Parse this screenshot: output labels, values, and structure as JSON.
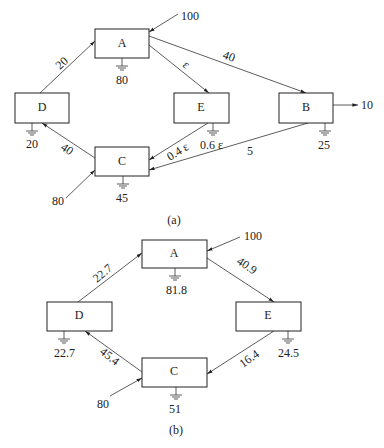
{
  "diagram_a": {
    "caption": "(a)",
    "nodes": {
      "A": {
        "label": "A",
        "loss": "80"
      },
      "B": {
        "label": "B",
        "loss": "25"
      },
      "C": {
        "label": "C",
        "loss": "45"
      },
      "D": {
        "label": "D",
        "loss": "20"
      },
      "E": {
        "label": "E",
        "loss": "0.6 ε"
      }
    },
    "inputs": {
      "A": "100",
      "C": "80"
    },
    "outputs": {
      "B": "10"
    },
    "edges": {
      "D_A": "20",
      "A_E": "ε",
      "A_B": "40",
      "C_D": "40",
      "E_C": "0.4 ε",
      "B_C": "5"
    }
  },
  "diagram_b": {
    "caption": "(b)",
    "nodes": {
      "A": {
        "label": "A",
        "loss": "81.8"
      },
      "C": {
        "label": "C",
        "loss": "51"
      },
      "D": {
        "label": "D",
        "loss": "22.7"
      },
      "E": {
        "label": "E",
        "loss": "24.5"
      }
    },
    "inputs": {
      "A": "100",
      "C": "80"
    },
    "edges": {
      "D_A": "22.7",
      "A_E": "40.9",
      "C_D": "45.4",
      "E_C": "16.4"
    }
  }
}
